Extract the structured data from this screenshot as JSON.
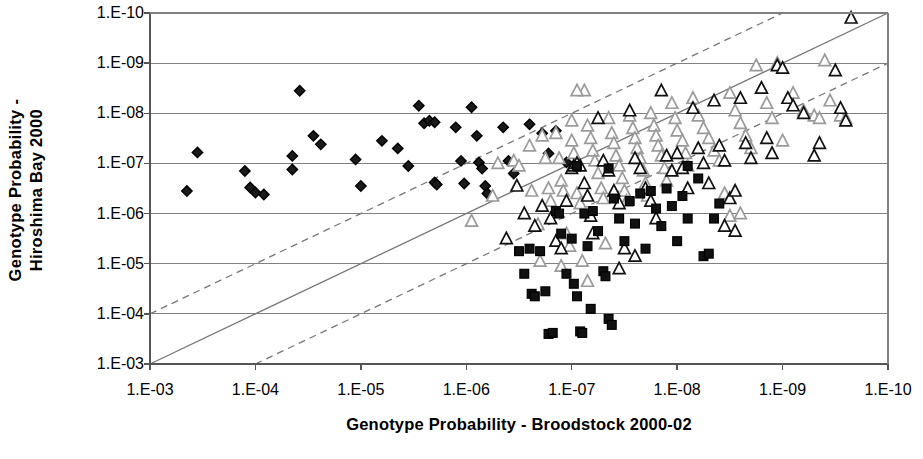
{
  "chart_data": {
    "type": "scatter",
    "title": "",
    "xlabel": "Genotype Probability - Broodstock 2000-02",
    "ylabel": "Genotype Probability - Hiroshima Bay 2000",
    "ylabel_line1": "Genotype Probability -",
    "ylabel_line2": "Hiroshima Bay 2000",
    "x_scale": "log-reversed",
    "y_scale": "log-reversed",
    "xticks": [
      "1.E-03",
      "1.E-04",
      "1.E-05",
      "1.E-06",
      "1.E-07",
      "1.E-08",
      "1.E-09",
      "1.E-10"
    ],
    "yticks": [
      "1.E-10",
      "1.E-09",
      "1.E-08",
      "1.E-07",
      "1.E-06",
      "1.E-05",
      "1.E-04",
      "1.E-03"
    ],
    "xlim_exp": [
      -3,
      -10
    ],
    "ylim_exp": [
      -3,
      -10
    ],
    "grid": "horizontal",
    "legend": "none",
    "colors": {
      "axis": "#555555",
      "grid": "#808080",
      "black_marker": "#111111",
      "gray_marker": "#9a9a9a",
      "reference_line": "#777777"
    },
    "reference_lines": [
      {
        "name": "one-to-one",
        "style": "solid",
        "x_exp": [
          -3,
          -10
        ],
        "y_exp": [
          -3,
          -10
        ]
      },
      {
        "name": "upper-offset",
        "style": "dashed",
        "x_exp": [
          -3,
          -9
        ],
        "y_exp": [
          -4,
          -10
        ]
      },
      {
        "name": "lower-offset",
        "style": "dashed",
        "x_exp": [
          -4,
          -10
        ],
        "y_exp": [
          -3,
          -9
        ]
      }
    ],
    "series": [
      {
        "name": "diamonds",
        "marker": "diamond",
        "fill": "#1a1a1a",
        "stroke": "#000000",
        "points_exp": [
          [
            -3.35,
            -6.45
          ],
          [
            -3.45,
            -7.22
          ],
          [
            -3.9,
            -6.85
          ],
          [
            -3.95,
            -6.52
          ],
          [
            -4.0,
            -6.42
          ],
          [
            -4.08,
            -6.38
          ],
          [
            -4.35,
            -7.15
          ],
          [
            -4.35,
            -6.88
          ],
          [
            -4.42,
            -8.45
          ],
          [
            -4.55,
            -7.55
          ],
          [
            -4.62,
            -7.38
          ],
          [
            -4.95,
            -7.08
          ],
          [
            -5.0,
            -6.55
          ],
          [
            -5.2,
            -7.45
          ],
          [
            -5.35,
            -7.3
          ],
          [
            -5.45,
            -6.95
          ],
          [
            -5.55,
            -8.15
          ],
          [
            -5.6,
            -7.8
          ],
          [
            -5.65,
            -7.85
          ],
          [
            -5.7,
            -7.82
          ],
          [
            -5.7,
            -6.62
          ],
          [
            -5.72,
            -6.58
          ],
          [
            -5.9,
            -7.72
          ],
          [
            -5.95,
            -7.05
          ],
          [
            -5.98,
            -6.6
          ],
          [
            -6.05,
            -8.12
          ],
          [
            -6.1,
            -7.55
          ],
          [
            -6.12,
            -7.02
          ],
          [
            -6.15,
            -6.9
          ],
          [
            -6.18,
            -6.55
          ],
          [
            -6.2,
            -6.4
          ],
          [
            -6.35,
            -7.72
          ],
          [
            -6.4,
            -7.05
          ],
          [
            -6.45,
            -6.8
          ],
          [
            -6.6,
            -7.78
          ],
          [
            -6.72,
            -7.6
          ],
          [
            -6.78,
            -7.2
          ],
          [
            -6.85,
            -7.65
          ],
          [
            -6.95,
            -7.02
          ]
        ]
      },
      {
        "name": "gray-triangles",
        "marker": "triangle",
        "fill": "none",
        "stroke": "#9a9a9a",
        "points_exp": [
          [
            -6.05,
            -5.85
          ],
          [
            -6.25,
            -6.35
          ],
          [
            -6.3,
            -7.0
          ],
          [
            -6.45,
            -7.05
          ],
          [
            -6.5,
            -6.95
          ],
          [
            -6.6,
            -7.35
          ],
          [
            -6.62,
            -6.45
          ],
          [
            -6.68,
            -5.78
          ],
          [
            -6.7,
            -5.05
          ],
          [
            -6.72,
            -7.55
          ],
          [
            -6.75,
            -7.1
          ],
          [
            -6.78,
            -6.5
          ],
          [
            -6.8,
            -6.25
          ],
          [
            -6.85,
            -7.6
          ],
          [
            -6.88,
            -7.1
          ],
          [
            -6.9,
            -6.65
          ],
          [
            -6.92,
            -6.45
          ],
          [
            -6.95,
            -5.6
          ],
          [
            -6.98,
            -5.35
          ],
          [
            -7.0,
            -7.85
          ],
          [
            -7.0,
            -7.45
          ],
          [
            -7.02,
            -7.2
          ],
          [
            -7.05,
            -7.0
          ],
          [
            -7.05,
            -6.4
          ],
          [
            -7.08,
            -6.2
          ],
          [
            -7.1,
            -5.05
          ],
          [
            -7.12,
            -8.45
          ],
          [
            -7.15,
            -7.75
          ],
          [
            -7.18,
            -7.5
          ],
          [
            -7.2,
            -7.25
          ],
          [
            -7.22,
            -7.05
          ],
          [
            -7.25,
            -6.8
          ],
          [
            -7.28,
            -6.5
          ],
          [
            -7.3,
            -6.3
          ],
          [
            -7.32,
            -5.4
          ],
          [
            -7.35,
            -7.9
          ],
          [
            -7.38,
            -7.6
          ],
          [
            -7.4,
            -7.4
          ],
          [
            -7.42,
            -7.15
          ],
          [
            -7.45,
            -6.95
          ],
          [
            -7.48,
            -6.7
          ],
          [
            -7.5,
            -6.45
          ],
          [
            -7.52,
            -6.25
          ],
          [
            -7.55,
            -7.95
          ],
          [
            -7.58,
            -7.7
          ],
          [
            -7.6,
            -7.5
          ],
          [
            -7.62,
            -7.3
          ],
          [
            -7.65,
            -7.1
          ],
          [
            -7.68,
            -6.85
          ],
          [
            -7.7,
            -6.6
          ],
          [
            -7.72,
            -6.35
          ],
          [
            -7.75,
            -8.0
          ],
          [
            -7.78,
            -7.75
          ],
          [
            -7.8,
            -7.55
          ],
          [
            -7.82,
            -7.35
          ],
          [
            -7.85,
            -7.15
          ],
          [
            -7.88,
            -6.9
          ],
          [
            -7.9,
            -6.65
          ],
          [
            -7.95,
            -8.2
          ],
          [
            -7.98,
            -7.9
          ],
          [
            -8.0,
            -7.65
          ],
          [
            -8.05,
            -7.45
          ],
          [
            -8.08,
            -7.2
          ],
          [
            -8.1,
            -6.95
          ],
          [
            -8.15,
            -8.3
          ],
          [
            -8.2,
            -7.95
          ],
          [
            -8.25,
            -7.7
          ],
          [
            -8.3,
            -7.5
          ],
          [
            -8.35,
            -7.25
          ],
          [
            -8.4,
            -7.05
          ],
          [
            -8.45,
            -6.4
          ],
          [
            -8.5,
            -8.4
          ],
          [
            -8.55,
            -8.05
          ],
          [
            -8.6,
            -7.8
          ],
          [
            -8.65,
            -7.55
          ],
          [
            -8.7,
            -7.3
          ],
          [
            -8.75,
            -8.95
          ],
          [
            -8.8,
            -8.5
          ],
          [
            -8.85,
            -8.2
          ],
          [
            -8.9,
            -7.9
          ],
          [
            -9.0,
            -7.45
          ],
          [
            -9.1,
            -8.4
          ],
          [
            -9.2,
            -8.05
          ],
          [
            -9.3,
            -7.95
          ],
          [
            -9.35,
            -7.9
          ],
          [
            -9.4,
            -9.05
          ],
          [
            -9.45,
            -8.25
          ],
          [
            -9.55,
            -7.95
          ],
          [
            -9.6,
            -7.9
          ],
          [
            -8.95,
            -9.0
          ],
          [
            -8.5,
            -5.95
          ],
          [
            -8.6,
            -6.0
          ],
          [
            -7.05,
            -8.45
          ],
          [
            -6.9,
            -4.95
          ],
          [
            -7.15,
            -4.65
          ]
        ]
      },
      {
        "name": "black-triangles",
        "marker": "triangle",
        "fill": "none",
        "stroke": "#111111",
        "points_exp": [
          [
            -6.38,
            -5.5
          ],
          [
            -6.48,
            -6.55
          ],
          [
            -6.55,
            -6.0
          ],
          [
            -6.65,
            -5.75
          ],
          [
            -6.72,
            -6.15
          ],
          [
            -6.8,
            -5.9
          ],
          [
            -6.85,
            -5.45
          ],
          [
            -6.9,
            -5.3
          ],
          [
            -6.95,
            -6.25
          ],
          [
            -7.0,
            -6.9
          ],
          [
            -7.02,
            -6.95
          ],
          [
            -7.05,
            -7.0
          ],
          [
            -7.08,
            -6.95
          ],
          [
            -7.12,
            -6.6
          ],
          [
            -7.15,
            -6.35
          ],
          [
            -7.18,
            -5.95
          ],
          [
            -7.2,
            -5.6
          ],
          [
            -7.25,
            -7.9
          ],
          [
            -7.3,
            -7.05
          ],
          [
            -7.35,
            -6.85
          ],
          [
            -7.4,
            -6.45
          ],
          [
            -7.45,
            -6.2
          ],
          [
            -7.5,
            -5.3
          ],
          [
            -7.55,
            -8.05
          ],
          [
            -7.6,
            -7.1
          ],
          [
            -7.65,
            -6.9
          ],
          [
            -7.7,
            -6.5
          ],
          [
            -7.75,
            -6.25
          ],
          [
            -7.8,
            -5.9
          ],
          [
            -7.85,
            -8.45
          ],
          [
            -7.9,
            -7.15
          ],
          [
            -7.95,
            -6.85
          ],
          [
            -8.0,
            -7.2
          ],
          [
            -8.05,
            -6.9
          ],
          [
            -8.1,
            -6.5
          ],
          [
            -8.15,
            -8.1
          ],
          [
            -8.2,
            -7.3
          ],
          [
            -8.25,
            -7.0
          ],
          [
            -8.3,
            -6.6
          ],
          [
            -8.35,
            -8.25
          ],
          [
            -8.4,
            -7.35
          ],
          [
            -8.45,
            -7.05
          ],
          [
            -8.5,
            -6.3
          ],
          [
            -8.55,
            -6.45
          ],
          [
            -8.6,
            -8.3
          ],
          [
            -8.65,
            -7.4
          ],
          [
            -8.7,
            -7.1
          ],
          [
            -8.8,
            -8.5
          ],
          [
            -8.85,
            -7.5
          ],
          [
            -8.9,
            -7.2
          ],
          [
            -8.95,
            -8.95
          ],
          [
            -9.0,
            -8.9
          ],
          [
            -9.05,
            -8.3
          ],
          [
            -9.1,
            -8.15
          ],
          [
            -9.2,
            -8.0
          ],
          [
            -9.3,
            -7.15
          ],
          [
            -9.35,
            -7.4
          ],
          [
            -9.5,
            -8.85
          ],
          [
            -9.55,
            -8.1
          ],
          [
            -9.65,
            -9.9
          ],
          [
            -9.6,
            -7.85
          ],
          [
            -8.45,
            -5.75
          ],
          [
            -8.55,
            -5.65
          ],
          [
            -7.6,
            -5.15
          ],
          [
            -7.45,
            -4.9
          ]
        ]
      },
      {
        "name": "squares",
        "marker": "square",
        "fill": "#111111",
        "stroke": "#000000",
        "points_exp": [
          [
            -6.5,
            -5.25
          ],
          [
            -6.55,
            -4.8
          ],
          [
            -6.6,
            -5.3
          ],
          [
            -6.62,
            -4.4
          ],
          [
            -6.65,
            -4.35
          ],
          [
            -6.7,
            -5.25
          ],
          [
            -6.75,
            -4.45
          ],
          [
            -6.78,
            -3.6
          ],
          [
            -6.82,
            -3.62
          ],
          [
            -6.9,
            -5.6
          ],
          [
            -6.95,
            -4.8
          ],
          [
            -7.0,
            -5.5
          ],
          [
            -7.02,
            -4.6
          ],
          [
            -7.05,
            -4.35
          ],
          [
            -7.08,
            -3.65
          ],
          [
            -7.1,
            -3.62
          ],
          [
            -7.12,
            -6.0
          ],
          [
            -7.15,
            -5.35
          ],
          [
            -7.18,
            -4.1
          ],
          [
            -7.2,
            -6.05
          ],
          [
            -7.25,
            -5.65
          ],
          [
            -7.3,
            -4.85
          ],
          [
            -7.32,
            -4.75
          ],
          [
            -7.35,
            -3.9
          ],
          [
            -7.38,
            -3.78
          ],
          [
            -7.4,
            -6.3
          ],
          [
            -7.45,
            -5.9
          ],
          [
            -7.5,
            -5.45
          ],
          [
            -7.55,
            -6.25
          ],
          [
            -7.6,
            -5.8
          ],
          [
            -7.65,
            -6.4
          ],
          [
            -7.7,
            -5.3
          ],
          [
            -7.75,
            -6.45
          ],
          [
            -7.8,
            -6.1
          ],
          [
            -7.85,
            -5.75
          ],
          [
            -7.9,
            -6.5
          ],
          [
            -7.95,
            -6.15
          ],
          [
            -8.0,
            -5.45
          ],
          [
            -8.05,
            -6.35
          ],
          [
            -8.1,
            -5.9
          ],
          [
            -8.2,
            -6.7
          ],
          [
            -8.25,
            -5.15
          ],
          [
            -8.3,
            -5.2
          ],
          [
            -8.35,
            -5.9
          ],
          [
            -8.4,
            -6.2
          ],
          [
            -7.05,
            -6.95
          ],
          [
            -7.35,
            -6.9
          ],
          [
            -8.1,
            -6.95
          ],
          [
            -6.85,
            -6.05
          ],
          [
            -6.88,
            -6.0
          ]
        ]
      }
    ]
  }
}
